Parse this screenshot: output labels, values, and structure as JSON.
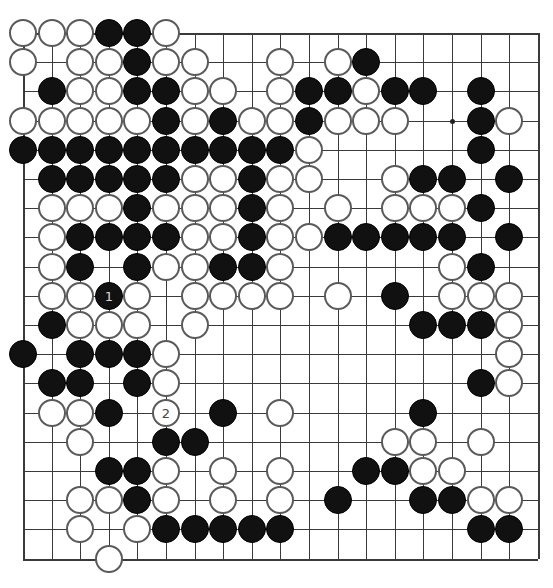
{
  "board": {
    "size": 19,
    "origin_x": 23,
    "origin_y": 33,
    "col_spacing": 28.6,
    "row_spacing": 29.2,
    "colors": {
      "black": "#111111",
      "white": "#ffffff",
      "white_border": "#5a5a5a",
      "line": "#3a3a3a"
    },
    "star_points": [
      [
        3,
        15
      ]
    ],
    "rows": [
      "WWWBBW.............",
      "W.WWBWW..W.WB......",
      ".BWWBBWW.WBBWBB.B..",
      "WWWWWBWBWWBWWW..BW.",
      "BBBBBBBBBBW.....B..",
      ".BBBBBWWBWW..WBB.B.",
      ".WWWBWWWBW.W.WWWB..",
      ".WBBBBWWBWWBBBBB.B.",
      ".WB.BWWBBW.....WB..",
      ".WWBW.WWWW.W.B.WWW.",
      ".BWWW.W.......BBBW.",
      "B.BBBW...........W.",
      ".BB.BW..........BW.",
      ".WWB.W.B.W....B....",
      "..W..BB......WW.W..",
      "...BBW.W.W..BBWW...",
      "..WWBW.W.W.B..BBWW.",
      "..W.WBBBBB......BB.",
      "...W..............."
    ],
    "labels": [
      {
        "row": 9,
        "col": 3,
        "color": "B",
        "text": "1"
      },
      {
        "row": 13,
        "col": 5,
        "color": "W",
        "text": "2"
      }
    ]
  }
}
